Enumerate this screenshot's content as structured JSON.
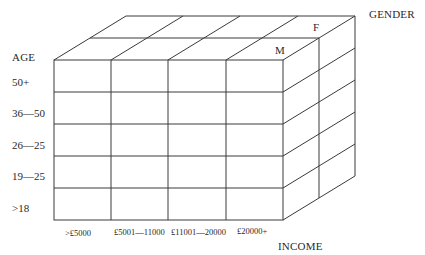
{
  "diagram": {
    "type": "olap-cube",
    "line_color": "#3a3a3a",
    "axes": {
      "age": {
        "title": "AGE",
        "categories": [
          "50+",
          "36—50",
          "26—25",
          "19—25",
          ">18"
        ]
      },
      "income": {
        "title": "INCOME",
        "categories": [
          ">£5000",
          "£5001—11000",
          "£11001—20000",
          "£20000+"
        ]
      },
      "gender": {
        "title": "GENDER",
        "categories": [
          "M",
          "F"
        ]
      }
    }
  }
}
